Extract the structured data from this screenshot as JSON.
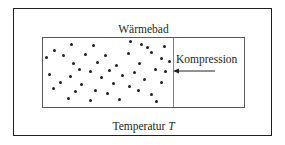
{
  "figure": {
    "background_color": "#ffffff",
    "line_color": "#231f20",
    "inner_line_color": "#58595b",
    "piston_color": "#808285",
    "molecule_color": "#231f20"
  },
  "labels": {
    "heat_bath": "Wärmebad",
    "temperature_prefix": "Temperatur",
    "temperature_symbol": "T",
    "compression": "Kompression"
  },
  "diagram_data": {
    "type": "physics-schematic",
    "outer_box": {
      "x": 13,
      "y": 8,
      "width": 259,
      "height": 128,
      "role": "heat-bath"
    },
    "inner_box": {
      "x": 42,
      "y": 37,
      "width": 203,
      "height": 71,
      "role": "gas-container"
    },
    "piston": {
      "x": 172,
      "y_top": 37,
      "y_bottom": 107,
      "direction": "left",
      "role": "movable-wall"
    },
    "arrow": {
      "from_x": 218,
      "to_x": 176,
      "y": 72,
      "points": "left"
    },
    "molecule_count": 45,
    "molecule_radius": 1.5,
    "molecules": [
      [
        11,
        12
      ],
      [
        28,
        6
      ],
      [
        50,
        7
      ],
      [
        87,
        3
      ],
      [
        98,
        6
      ],
      [
        104,
        9
      ],
      [
        121,
        8
      ],
      [
        3,
        19
      ],
      [
        20,
        17
      ],
      [
        42,
        16
      ],
      [
        62,
        17
      ],
      [
        85,
        15
      ],
      [
        108,
        14
      ],
      [
        118,
        20
      ],
      [
        30,
        25
      ],
      [
        54,
        24
      ],
      [
        73,
        27
      ],
      [
        96,
        25
      ],
      [
        126,
        23
      ],
      [
        36,
        31
      ],
      [
        47,
        33
      ],
      [
        66,
        32
      ],
      [
        91,
        34
      ],
      [
        112,
        31
      ],
      [
        122,
        33
      ],
      [
        6,
        36
      ],
      [
        27,
        38
      ],
      [
        58,
        39
      ],
      [
        79,
        37
      ],
      [
        101,
        41
      ],
      [
        17,
        44
      ],
      [
        38,
        46
      ],
      [
        70,
        45
      ],
      [
        86,
        48
      ],
      [
        118,
        44
      ],
      [
        10,
        50
      ],
      [
        32,
        53
      ],
      [
        52,
        52
      ],
      [
        64,
        55
      ],
      [
        95,
        52
      ],
      [
        108,
        56
      ],
      [
        25,
        60
      ],
      [
        47,
        62
      ],
      [
        76,
        61
      ],
      [
        113,
        63
      ]
    ]
  }
}
